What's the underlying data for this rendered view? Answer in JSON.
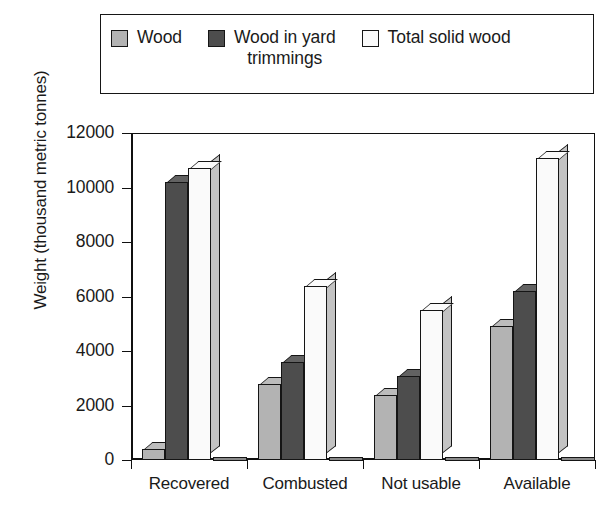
{
  "legend": {
    "items": [
      {
        "label": "Wood",
        "color": "#b3b3b3",
        "name": "legend-wood"
      },
      {
        "label": "Wood in yard\ntrimmings",
        "color": "#4d4d4d",
        "name": "legend-wood-in-yard-trimmings"
      },
      {
        "label": "Total solid wood",
        "color": "#fafafa",
        "name": "legend-total-solid-wood"
      }
    ]
  },
  "axes": {
    "ylabel": "Weight (thousand metric tonnes)",
    "yticks": [
      "0",
      "2000",
      "4000",
      "6000",
      "8000",
      "10000",
      "12000"
    ],
    "xticks": [
      "Recovered",
      "Combusted",
      "Not usable",
      "Available"
    ]
  },
  "chart_data": {
    "type": "bar",
    "title": "",
    "xlabel": "",
    "ylabel": "Weight (thousand metric tonnes)",
    "ylim": [
      0,
      12000
    ],
    "ytick_step": 2000,
    "grid": false,
    "legend_position": "top",
    "categories": [
      "Recovered",
      "Combusted",
      "Not usable",
      "Available"
    ],
    "series": [
      {
        "name": "Wood",
        "color": "#b3b3b3",
        "values": [
          400,
          2800,
          2400,
          4900
        ]
      },
      {
        "name": "Wood in yard trimmings",
        "color": "#4d4d4d",
        "values": [
          10200,
          3600,
          3100,
          6200
        ]
      },
      {
        "name": "Total solid wood",
        "color": "#fafafa",
        "values": [
          10700,
          6400,
          5500,
          11100
        ]
      }
    ]
  }
}
